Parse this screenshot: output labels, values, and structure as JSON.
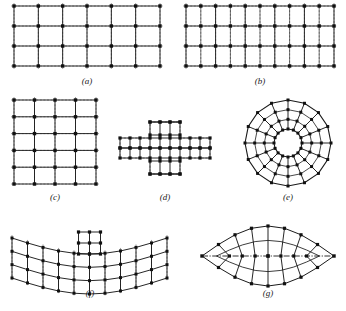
{
  "figure": {
    "title": "",
    "background": "#ffffff",
    "ink": "#1a1a1a",
    "dash_color": "#8a8a8a",
    "node_color": "#111111",
    "panels": [
      {
        "id": "a",
        "caption": "(a)",
        "name": "rectangular-plate-coarse-mesh",
        "type": "rectangular-grid",
        "cols": 6,
        "rows": 3,
        "nodes_x": 7,
        "nodes_y": 4,
        "x": 14,
        "y": 6,
        "w": 146,
        "h": 60,
        "caption_x": 87,
        "caption_y": 84
      },
      {
        "id": "b",
        "caption": "(b)",
        "name": "rectangular-plate-refined-mesh",
        "type": "rectangular-grid",
        "cols": 10,
        "rows": 3,
        "nodes_x": 11,
        "nodes_y": 4,
        "x": 186,
        "y": 6,
        "w": 148,
        "h": 60,
        "caption_x": 260,
        "caption_y": 84
      },
      {
        "id": "c",
        "caption": "(c)",
        "name": "square-plate-mesh",
        "type": "rectangular-grid",
        "cols": 4,
        "rows": 5,
        "nodes_x": 5,
        "nodes_y": 6,
        "x": 14,
        "y": 100,
        "w": 82,
        "h": 84,
        "caption_x": 55,
        "caption_y": 200
      },
      {
        "id": "d",
        "caption": "(d)",
        "name": "cruciform-plate-mesh",
        "type": "cross-grid",
        "cell": 10,
        "arm_cols": 3,
        "center_cols": 3,
        "cx": 165,
        "cy": 148,
        "caption_x": 165,
        "caption_y": 200
      },
      {
        "id": "e",
        "caption": "(e)",
        "name": "annular-ring-mesh",
        "type": "polar-annulus",
        "spokes": 16,
        "rings": 3,
        "r_inner": 14,
        "r_outer": 43,
        "cx": 288,
        "cy": 143,
        "caption_x": 288,
        "caption_y": 200
      },
      {
        "id": "f",
        "caption": "(f)",
        "name": "curved-shell-with-stiffener-mesh",
        "type": "curved-shell",
        "cols": 10,
        "rows": 3,
        "stiffener_cols": 2,
        "stiffener_rows": 2,
        "x": 12,
        "y": 238,
        "w": 155,
        "h": 40,
        "caption_x": 90,
        "caption_y": 296
      },
      {
        "id": "g",
        "caption": "(g)",
        "name": "lenticular-shell-mesh",
        "type": "lens",
        "cols": 8,
        "cx": 268,
        "cy": 256,
        "rx": 66,
        "ry": 30,
        "caption_x": 268,
        "caption_y": 296
      }
    ]
  }
}
